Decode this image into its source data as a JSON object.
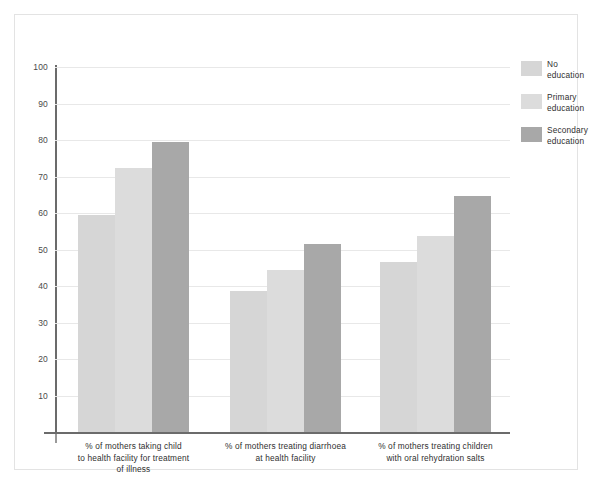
{
  "chart_data": {
    "type": "bar",
    "title": "",
    "subtitle": "",
    "xlabel": "",
    "ylabel": "",
    "ylim": [
      0,
      100
    ],
    "ytick_values": [
      100,
      90,
      80,
      70,
      60,
      50,
      40,
      30,
      20,
      10
    ],
    "ytick_labels": [
      "100",
      "90",
      "80",
      "70",
      "60",
      "50",
      "40",
      "30",
      "20",
      "10"
    ],
    "grid": true,
    "legend_position": "right",
    "categories": [
      "% of mothers taking child to health facility for treatment of illness",
      "% of mothers treating diarrhoea at health facility",
      "% of mothers treating children with oral rehydration salts"
    ],
    "category_lines": [
      [
        "% of mothers taking child",
        "to health facility for treatment",
        "of illness"
      ],
      [
        "% of mothers treating diarrhoea",
        "at health facility"
      ],
      [
        "% of mothers treating children",
        "with oral rehydration salts"
      ]
    ],
    "series": [
      {
        "name": "No education",
        "name_lines": [
          "No",
          "education"
        ],
        "color": "#d6d6d6",
        "values": [
          59.5,
          38.6,
          46.6
        ]
      },
      {
        "name": "Primary education",
        "name_lines": [
          "Primary",
          "education"
        ],
        "color": "#dcdcdc",
        "values": [
          72.3,
          44.4,
          53.8
        ]
      },
      {
        "name": "Secondary education",
        "name_lines": [
          "Secondary",
          "education"
        ],
        "color": "#a8a8a8",
        "values": [
          79.5,
          51.6,
          64.7
        ]
      }
    ]
  },
  "colors": {
    "no_education": "#d6d6d6",
    "primary_education": "#dcdcdc",
    "secondary_education": "#a8a8a8",
    "axis": "#6b6b6b",
    "gridline": "#e8e8e8",
    "frame": "#e3e3e3",
    "text": "#2f2f2f",
    "background": "#ffffff"
  }
}
